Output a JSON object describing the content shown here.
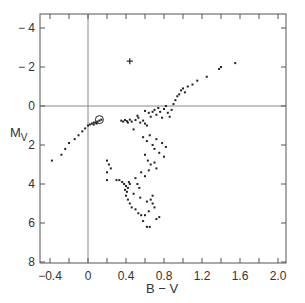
{
  "chart_data": {
    "type": "scatter",
    "title": "",
    "xlabel": "B-V",
    "ylabel": "M",
    "ylabel_sub": "V",
    "xlim": [
      -0.5,
      2.1
    ],
    "ylim": [
      8.3,
      -4.9
    ],
    "y_inverted": true,
    "grid": false,
    "reference_lines": {
      "x": 0,
      "y": 0
    },
    "x_ticks": [
      -0.4,
      0,
      0.4,
      0.8,
      1.2,
      1.6,
      2.0
    ],
    "x_tick_labels": [
      "-0.4",
      "0",
      "0.4",
      "0.8",
      "1.2",
      "1.6",
      "2.0"
    ],
    "y_ticks": [
      -4,
      -2,
      0,
      2,
      4,
      6,
      8
    ],
    "y_tick_labels": [
      "-4",
      "-2",
      "0",
      "2",
      "4",
      "6",
      "8"
    ],
    "annotations": [
      {
        "type": "plus-marker",
        "x": 0.44,
        "y": -2.3
      },
      {
        "type": "circle-marker",
        "x": 0.12,
        "y": 0.75
      }
    ],
    "series": [
      {
        "name": "stars",
        "points": [
          [
            -0.38,
            2.8
          ],
          [
            -0.28,
            2.5
          ],
          [
            -0.24,
            2.2
          ],
          [
            -0.2,
            1.9
          ],
          [
            -0.14,
            1.7
          ],
          [
            -0.1,
            1.5
          ],
          [
            -0.06,
            1.3
          ],
          [
            -0.03,
            1.15
          ],
          [
            0.0,
            1.0
          ],
          [
            0.02,
            0.95
          ],
          [
            0.04,
            0.9
          ],
          [
            0.06,
            0.85
          ],
          [
            0.08,
            0.85
          ],
          [
            0.1,
            0.8
          ],
          [
            0.12,
            0.75
          ],
          [
            0.14,
            0.7
          ],
          [
            0.06,
            0.95
          ],
          [
            0.09,
            0.9
          ],
          [
            0.35,
            0.75
          ],
          [
            0.37,
            0.8
          ],
          [
            0.39,
            0.72
          ],
          [
            0.41,
            0.78
          ],
          [
            0.42,
            0.85
          ],
          [
            0.44,
            0.7
          ],
          [
            0.46,
            0.8
          ],
          [
            0.5,
            0.72
          ],
          [
            0.53,
            0.6
          ],
          [
            0.55,
            0.85
          ],
          [
            0.58,
            0.75
          ],
          [
            0.6,
            0.9
          ],
          [
            0.62,
            1.0
          ],
          [
            0.48,
            1.2
          ],
          [
            0.52,
            0.5
          ],
          [
            0.6,
            0.25
          ],
          [
            0.64,
            0.35
          ],
          [
            0.66,
            0.55
          ],
          [
            0.68,
            0.3
          ],
          [
            0.7,
            0.2
          ],
          [
            0.72,
            0.45
          ],
          [
            0.74,
            0.1
          ],
          [
            0.76,
            0.3
          ],
          [
            0.78,
            0.6
          ],
          [
            0.8,
            0.15
          ],
          [
            0.82,
            0.0
          ],
          [
            0.84,
            0.35
          ],
          [
            0.86,
            0.55
          ],
          [
            0.88,
            0.2
          ],
          [
            0.9,
            -0.1
          ],
          [
            0.92,
            -0.3
          ],
          [
            0.94,
            -0.5
          ],
          [
            0.96,
            -0.6
          ],
          [
            0.98,
            -0.8
          ],
          [
            1.0,
            -0.9
          ],
          [
            1.02,
            -0.7
          ],
          [
            1.05,
            -1.0
          ],
          [
            1.1,
            -1.1
          ],
          [
            1.15,
            -1.3
          ],
          [
            1.25,
            -1.5
          ],
          [
            1.38,
            -1.9
          ],
          [
            1.4,
            -2.0
          ],
          [
            1.55,
            -2.2
          ],
          [
            0.58,
            1.6
          ],
          [
            0.62,
            1.8
          ],
          [
            0.65,
            1.5
          ],
          [
            0.68,
            2.0
          ],
          [
            0.7,
            2.2
          ],
          [
            0.72,
            1.7
          ],
          [
            0.75,
            2.4
          ],
          [
            0.78,
            1.9
          ],
          [
            0.8,
            2.6
          ],
          [
            0.82,
            2.1
          ],
          [
            0.6,
            2.5
          ],
          [
            0.63,
            2.8
          ],
          [
            0.66,
            3.0
          ],
          [
            0.7,
            2.9
          ],
          [
            0.72,
            3.2
          ],
          [
            0.56,
            3.4
          ],
          [
            0.6,
            3.6
          ],
          [
            0.64,
            3.3
          ],
          [
            0.5,
            3.7
          ],
          [
            0.52,
            4.0
          ],
          [
            0.54,
            4.2
          ],
          [
            0.48,
            4.5
          ],
          [
            0.55,
            4.7
          ],
          [
            0.2,
            2.8
          ],
          [
            0.22,
            3.0
          ],
          [
            0.2,
            3.4
          ],
          [
            0.24,
            3.2
          ],
          [
            0.2,
            3.8
          ],
          [
            0.3,
            3.8
          ],
          [
            0.33,
            3.8
          ],
          [
            0.36,
            3.9
          ],
          [
            0.38,
            4.0
          ],
          [
            0.4,
            4.1
          ],
          [
            0.42,
            4.2
          ],
          [
            0.39,
            4.3
          ],
          [
            0.41,
            4.4
          ],
          [
            0.43,
            3.9
          ],
          [
            0.44,
            4.0
          ],
          [
            0.4,
            4.6
          ],
          [
            0.42,
            4.8
          ],
          [
            0.44,
            5.0
          ],
          [
            0.46,
            5.2
          ],
          [
            0.5,
            5.3
          ],
          [
            0.53,
            5.5
          ],
          [
            0.56,
            5.6
          ],
          [
            0.6,
            5.6
          ],
          [
            0.64,
            5.4
          ],
          [
            0.58,
            5.9
          ],
          [
            0.62,
            6.2
          ],
          [
            0.65,
            6.2
          ],
          [
            0.68,
            5.0
          ],
          [
            0.72,
            5.8
          ],
          [
            0.75,
            5.7
          ],
          [
            0.7,
            5.2
          ],
          [
            0.68,
            4.6
          ],
          [
            0.66,
            4.8
          ],
          [
            0.62,
            4.9
          ]
        ]
      }
    ]
  }
}
